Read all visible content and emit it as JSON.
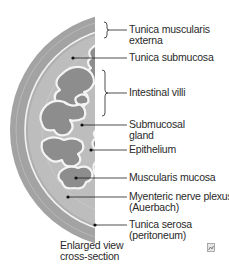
{
  "diagram": {
    "type": "anatomical cross-section",
    "colors": {
      "serosa_outer": "#9a9a9a",
      "muscularis": "#b3b3b3",
      "submucosa": "#c4c4c4",
      "villi_fill": "#8c8c8c",
      "villi_outline": "#f4f4f4",
      "ring_line": "#f2f2f2",
      "leader_line": "#222222",
      "text": "#2a2a2a"
    },
    "labels": [
      {
        "id": "tunica-muscularis-externa",
        "line1": "Tunica muscularis",
        "line2": "externa",
        "pointer": "bracket"
      },
      {
        "id": "tunica-submucosa",
        "line1": "Tunica submucosa",
        "line2": "",
        "pointer": "dot"
      },
      {
        "id": "intestinal-villi",
        "line1": "Intestinal villi",
        "line2": "",
        "pointer": "bracket"
      },
      {
        "id": "submucosal-gland",
        "line1": "Submucosal",
        "line2": "gland",
        "pointer": "dot"
      },
      {
        "id": "epithelium",
        "line1": "Epithelium",
        "line2": "",
        "pointer": "dot"
      },
      {
        "id": "muscularis-mucosa",
        "line1": "Muscularis mucosa",
        "line2": "",
        "pointer": "dot"
      },
      {
        "id": "myenteric-nerve-plexus",
        "line1": "Myenteric nerve plexus",
        "line2": "(Auerbach)",
        "pointer": "dot"
      },
      {
        "id": "tunica-serosa",
        "line1": "Tunica serosa",
        "line2": "(peritoneum)",
        "pointer": "dot"
      }
    ],
    "caption": {
      "line1": "Enlarged view",
      "line2": "cross-section"
    },
    "corner_icon": "image-icon"
  }
}
